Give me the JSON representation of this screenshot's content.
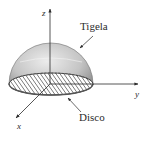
{
  "diagram": {
    "type": "hemisphere-3d",
    "labels": {
      "bowl": "Tigela",
      "disk": "Disco"
    },
    "axes": {
      "x": "x",
      "y": "y",
      "z": "z"
    },
    "colors": {
      "surface_light": "#e4e4e4",
      "surface_dark": "#8a8a8a",
      "hatch": "#3a3a3a",
      "axis": "#2b2b2b",
      "background": "#ffffff"
    }
  }
}
